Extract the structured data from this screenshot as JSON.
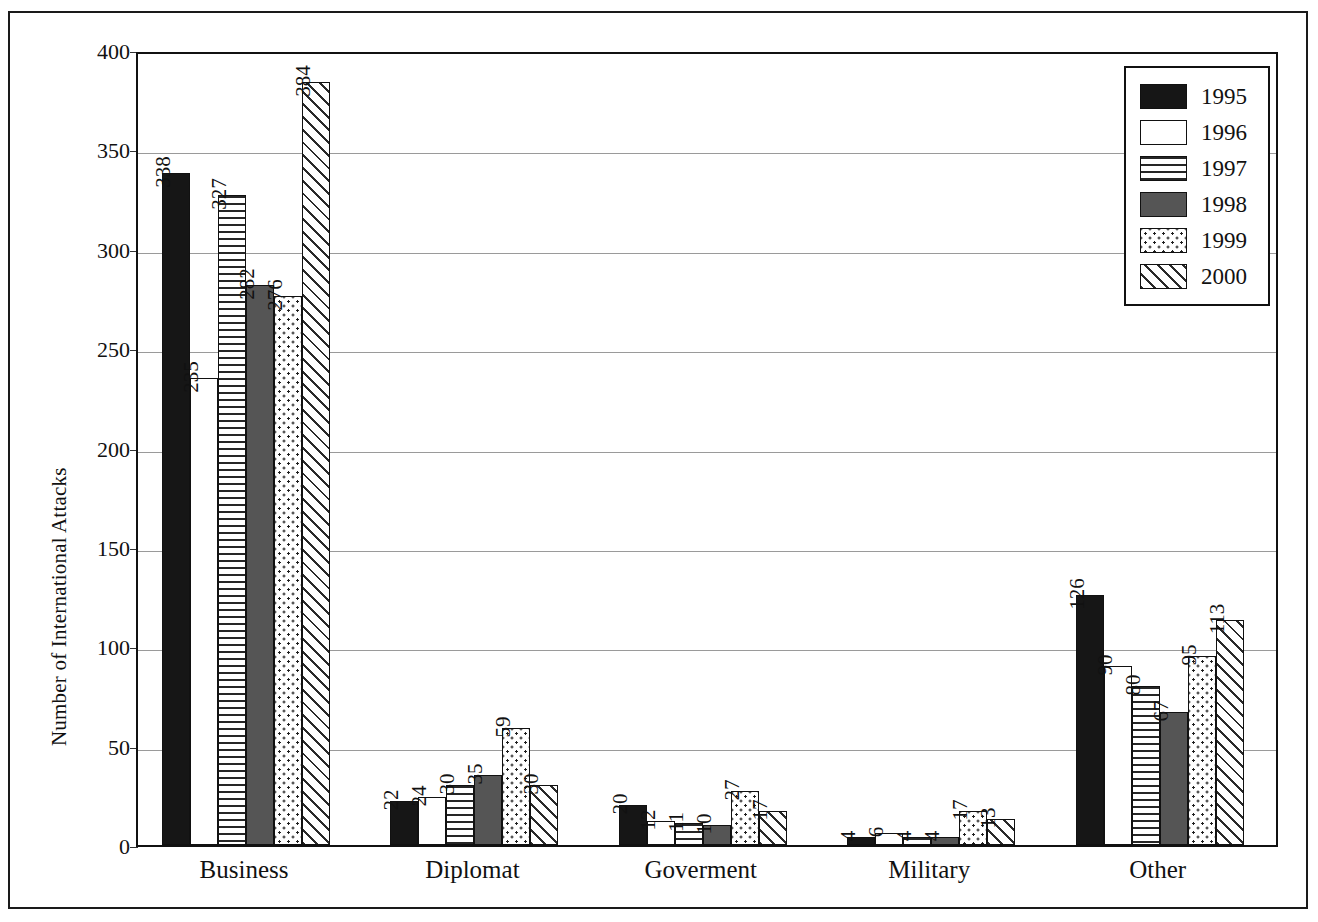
{
  "chart_data": {
    "type": "bar",
    "title": "",
    "xlabel": "",
    "ylabel": "Number of International Attacks",
    "ylim": [
      0,
      400
    ],
    "ytick_step": 50,
    "yticks": [
      "0",
      "50",
      "100",
      "150",
      "200",
      "250",
      "300",
      "350",
      "400"
    ],
    "grid": true,
    "legend_position": "top-right",
    "categories": [
      "Business",
      "Diplomat",
      "Goverment",
      "Military",
      "Other"
    ],
    "series": [
      {
        "name": "1995",
        "pattern": "solid-black",
        "values": [
          338,
          22,
          20,
          4,
          126
        ]
      },
      {
        "name": "1996",
        "pattern": "white",
        "values": [
          235,
          24,
          12,
          6,
          90
        ]
      },
      {
        "name": "1997",
        "pattern": "horizontal-lines",
        "values": [
          327,
          30,
          11,
          4,
          80
        ]
      },
      {
        "name": "1998",
        "pattern": "solid-gray",
        "values": [
          282,
          35,
          10,
          4,
          67
        ]
      },
      {
        "name": "1999",
        "pattern": "dotted",
        "values": [
          276,
          59,
          27,
          17,
          95
        ]
      },
      {
        "name": "2000",
        "pattern": "diagonal-hatch",
        "values": [
          384,
          30,
          17,
          13,
          113
        ]
      }
    ]
  },
  "colors": {
    "axis": "#111111",
    "grid": "#9a9a9a",
    "frame": "#1a1a1a",
    "s1995": "#161616",
    "s1996": "#ffffff",
    "s1997": "#262626",
    "s1998": "#555555",
    "s1999": "#1f1f1f",
    "s2000": "#2a2a2a"
  }
}
